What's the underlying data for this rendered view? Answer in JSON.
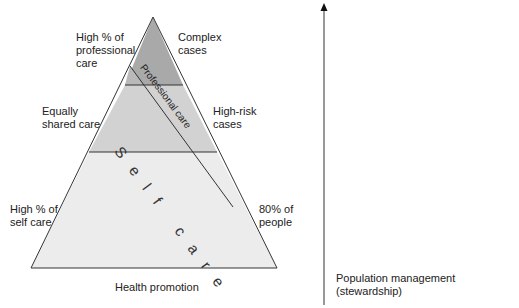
{
  "diagram": {
    "type": "pyramid",
    "colors": {
      "top_band": "#a9a9a9",
      "middle_band": "#d2d2d2",
      "bottom_band": "#ececec",
      "stroke": "#333333"
    },
    "bands": [
      {
        "name": "top",
        "label": "Complex cases"
      },
      {
        "name": "middle",
        "label": "High-risk cases"
      },
      {
        "name": "bottom",
        "label": "80% of people"
      }
    ],
    "left_labels": {
      "top": "High % of professional care",
      "top_lines": [
        "High % of",
        "professional",
        "care"
      ],
      "middle_lines": [
        "Equally",
        "shared care"
      ],
      "bottom_lines": [
        "High % of",
        "self care"
      ]
    },
    "right_labels": {
      "top_lines": [
        "Complex",
        "cases"
      ],
      "middle_lines": [
        "High-risk",
        "cases"
      ],
      "bottom_lines": [
        "80% of",
        "people"
      ]
    },
    "diagonal_label": "Professional care",
    "self_care_label": "Self care",
    "base_label": "Health promotion",
    "axis_label": "Population management (stewardship)"
  }
}
